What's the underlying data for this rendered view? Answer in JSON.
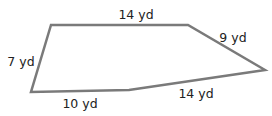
{
  "diagram": {
    "shape": "pentagon",
    "stroke_color": "#7a7a7a",
    "label_color": "#222222",
    "vertices": [
      [
        51,
        25
      ],
      [
        188,
        25
      ],
      [
        265,
        70
      ],
      [
        129,
        90
      ],
      [
        31,
        92
      ]
    ],
    "sides": [
      {
        "label": "14 yd",
        "x": 136,
        "y": 19
      },
      {
        "label": "9 yd",
        "x": 233,
        "y": 42
      },
      {
        "label": "14 yd",
        "x": 196,
        "y": 98
      },
      {
        "label": "10 yd",
        "x": 80,
        "y": 108
      },
      {
        "label": "7 yd",
        "x": 21,
        "y": 66
      }
    ]
  }
}
